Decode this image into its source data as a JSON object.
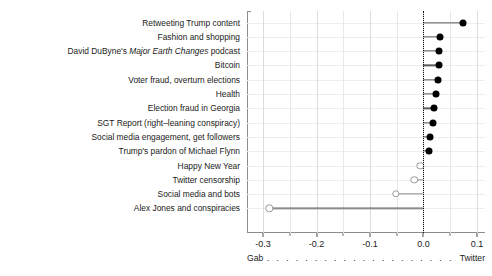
{
  "chart_data": {
    "type": "bar",
    "orientation": "horizontal-lollipop",
    "title": "",
    "subtitle": "",
    "xlabel": "",
    "ylabel": "",
    "xlim": [
      -0.33,
      0.115
    ],
    "ylim": [
      0,
      16
    ],
    "grid": true,
    "legend_position": "none",
    "zero_reference_line": 0.0,
    "axis_left_end_label": "Gab",
    "axis_right_end_label": "Twitter",
    "axis_connector": ". . . . . . . . . . . . . . . . . . . . . . . . . . . . . . . . . . . . . . .",
    "xticks": [
      -0.3,
      -0.2,
      -0.1,
      0.0,
      0.1
    ],
    "xticklabels": [
      "-0.3",
      "-0.2",
      "-0.1",
      "0.0",
      "0.1"
    ],
    "xminorticks": [
      -0.25,
      -0.15,
      -0.05,
      0.05
    ],
    "categories": [
      "Retweeting Trump content",
      "Fashion and shopping",
      "David DuByne's Major Earth Changes podcast",
      "Bitcoin",
      "Voter fraud, overturn elections",
      "Health",
      "Election fraud in Georgia",
      "SGT Report (right-leaning conspiracy)",
      "Social media engagement, get followers",
      "Trump's pardon of Michael Flynn",
      "Happy New Year",
      "Twitter censorship",
      "Social media and bots",
      "Alex Jones and conspiracies"
    ],
    "values": [
      0.074,
      0.031,
      0.029,
      0.029,
      0.027,
      0.023,
      0.019,
      0.018,
      0.013,
      0.011,
      -0.006,
      -0.017,
      -0.052,
      -0.288
    ],
    "point_styles": [
      "filled",
      "filled",
      "filled",
      "filled",
      "filled",
      "filled",
      "filled",
      "filled",
      "filled",
      "filled",
      "open",
      "open",
      "open",
      "open"
    ],
    "colors": {
      "filled_point": "#000000",
      "open_point_edge": "#9a9a9a",
      "open_point_fill": "#ffffff",
      "stem_positive": "#5a5a5a",
      "stem_negative": "#8a8a8a",
      "zero_line": "#101010",
      "grid": "#e8e8e8",
      "panel_border": "#8c8c8c",
      "text": "#1a1a1a"
    }
  },
  "labels": {
    "rows": [
      {
        "text": "Retweeting Trump content",
        "italic_part": ""
      },
      {
        "text": "Fashion and shopping",
        "italic_part": ""
      },
      {
        "pre": "David DuByne's ",
        "italic_part": "Major Earth Changes",
        "post": " podcast"
      },
      {
        "text": "Bitcoin",
        "italic_part": ""
      },
      {
        "text": "Voter fraud, overturn elections",
        "italic_part": ""
      },
      {
        "text": "Health",
        "italic_part": ""
      },
      {
        "text": "Election fraud in Georgia",
        "italic_part": ""
      },
      {
        "text": "SGT Report (right–leaning conspiracy)",
        "italic_part": ""
      },
      {
        "text": "Social media engagement, get followers",
        "italic_part": ""
      },
      {
        "text": "Trump's pardon of Michael Flynn",
        "italic_part": ""
      },
      {
        "text": "Happy New Year",
        "italic_part": ""
      },
      {
        "text": "Twitter censorship",
        "italic_part": ""
      },
      {
        "text": "Social media and bots",
        "italic_part": ""
      },
      {
        "text": "Alex Jones and conspiracies",
        "italic_part": ""
      }
    ]
  }
}
